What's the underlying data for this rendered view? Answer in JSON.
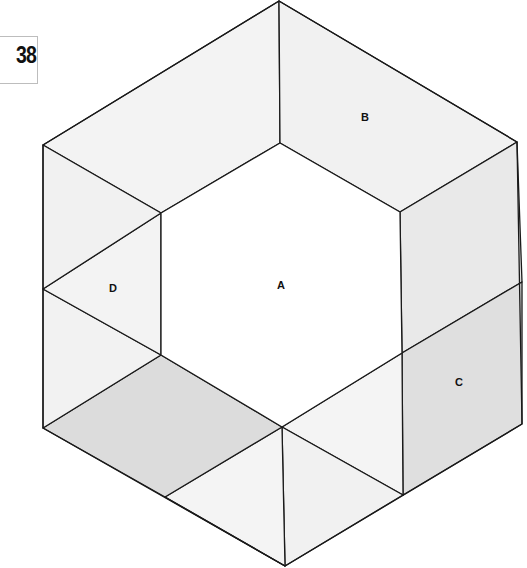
{
  "figure_number": "38",
  "labels": {
    "A": "A",
    "B": "B",
    "C": "C",
    "D": "D"
  },
  "colors": {
    "light_face": "#f1f1f1",
    "lighter_face": "#f6f6f6",
    "shaded_face": "#dedede",
    "inner_hexagon": "#ffffff",
    "stroke": "#1a1a1a"
  }
}
